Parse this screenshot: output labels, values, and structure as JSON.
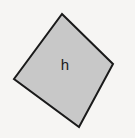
{
  "figure": {
    "name": "rotated-square-diagram",
    "canvas": {
      "width": 135,
      "height": 138,
      "background_color": "#f6f5f3"
    },
    "shape": {
      "kind": "rotated-square",
      "label": "h",
      "fill_color": "#c8c8c8",
      "stroke_color": "#1a1a1a",
      "stroke_width": 2,
      "vertices": [
        {
          "name": "top",
          "x": 62,
          "y": 14
        },
        {
          "name": "right",
          "x": 113,
          "y": 64
        },
        {
          "name": "bottom",
          "x": 79,
          "y": 127
        },
        {
          "name": "left",
          "x": 14,
          "y": 79
        }
      ],
      "points_attr": "62,14 113,64 79,127 14,79",
      "label_position": {
        "x": 65,
        "y": 66
      },
      "label_font_size": 15,
      "label_color": "#1b1b1b"
    }
  }
}
